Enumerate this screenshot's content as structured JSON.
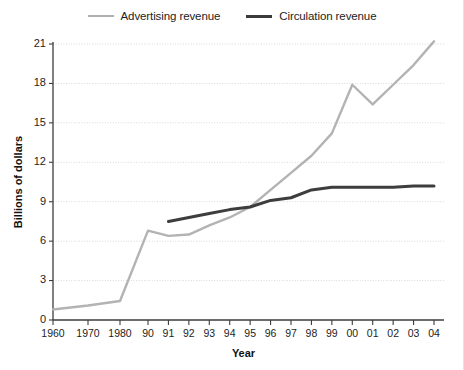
{
  "legend": {
    "position": "top-center",
    "entries": [
      {
        "label": "Advertising revenue",
        "color": "#b3b3b3",
        "key": "advertising"
      },
      {
        "label": "Circulation revenue",
        "color": "#3d3d3d",
        "key": "circulation"
      }
    ]
  },
  "axes": {
    "x_title": "Year",
    "y_title": "Billions of dollars",
    "y_ticks": [
      "0",
      "3",
      "6",
      "9",
      "12",
      "15",
      "18",
      "21"
    ],
    "x_ticks": [
      "1960",
      "1970",
      "1980",
      "90",
      "91",
      "92",
      "93",
      "94",
      "95",
      "96",
      "97",
      "98",
      "99",
      "00",
      "01",
      "02",
      "03",
      "04"
    ]
  },
  "chart_data": {
    "type": "line",
    "title": "",
    "subtitle": "",
    "xlabel": "Year",
    "ylabel": "Billions of dollars",
    "ylim": [
      0,
      21
    ],
    "yticks": [
      0,
      3,
      6,
      9,
      12,
      15,
      18,
      21
    ],
    "grid": true,
    "legend_position": "top-center",
    "categories": [
      "1960",
      "1970",
      "1980",
      "90",
      "91",
      "92",
      "93",
      "94",
      "95",
      "96",
      "97",
      "98",
      "99",
      "00",
      "01",
      "02",
      "03",
      "04"
    ],
    "x": [
      1960,
      1970,
      1980,
      1990,
      1991,
      1992,
      1993,
      1994,
      1995,
      1996,
      1997,
      1998,
      1999,
      2000,
      2001,
      2002,
      2003,
      2004
    ],
    "series": [
      {
        "name": "Advertising revenue",
        "color": "#b3b3b3",
        "values": [
          0.8,
          1.1,
          1.45,
          6.8,
          6.4,
          6.5,
          7.2,
          7.8,
          8.6,
          9.9,
          11.2,
          12.5,
          14.2,
          17.9,
          16.4,
          17.9,
          19.4,
          21.2
        ]
      },
      {
        "name": "Circulation revenue",
        "color": "#3d3d3d",
        "values": [
          null,
          null,
          null,
          null,
          7.5,
          7.8,
          8.1,
          8.4,
          8.6,
          9.1,
          9.3,
          9.9,
          10.1,
          10.1,
          10.1,
          10.1,
          10.2,
          10.2
        ]
      }
    ]
  }
}
